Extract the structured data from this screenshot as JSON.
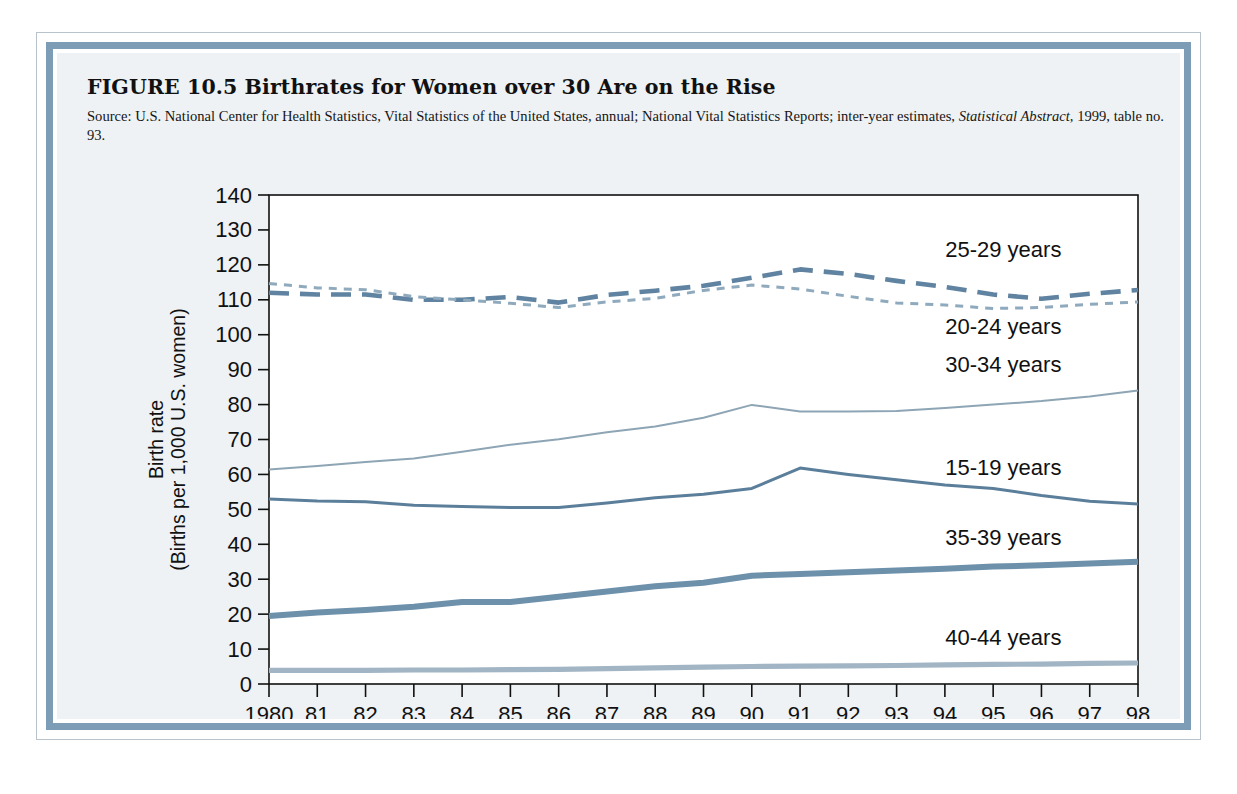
{
  "figure": {
    "title": "FIGURE 10.5  Birthrates for Women over 30 Are on the Rise",
    "source_prefix": "Source: U.S. National Center for Health Statistics, Vital Statistics of the United States, annual; National Vital Statistics Reports; inter-year estimates, ",
    "source_italic_1": "Statistical Abstract,",
    "source_suffix": " 1999, table no. 93."
  },
  "colors": {
    "frame_blue": "#7d9cb5",
    "panel_background": "#eef2f4",
    "plot_background": "#ffffff",
    "axis": "#111111",
    "series_15_19": "#5b7f9b",
    "series_20_24": "#8fa9bd",
    "series_25_29": "#5f83a0",
    "series_30_34": "#8da5b4",
    "series_35_39": "#6d90ab",
    "series_40_44": "#a2b5c4"
  },
  "chart_data": {
    "type": "line",
    "title": "Birthrates for Women over 30 Are on the Rise",
    "xlabel": "",
    "ylabel": "Birth rate (Births per 1,000 U.S. women)",
    "ylabel_line1": "Birth rate",
    "ylabel_line2": "(Births per 1,000 U.S. women)",
    "ylim": [
      0,
      140
    ],
    "yticks": [
      0,
      10,
      20,
      30,
      40,
      50,
      60,
      70,
      80,
      90,
      100,
      110,
      120,
      130,
      140
    ],
    "ytick_labels": [
      "0",
      "10",
      "20",
      "30",
      "40",
      "50",
      "60",
      "70",
      "80",
      "90",
      "100",
      "110",
      "120",
      "130",
      "140"
    ],
    "grid": false,
    "legend_position": "inline-right-labels",
    "x": [
      1980,
      1981,
      1982,
      1983,
      1984,
      1985,
      1986,
      1987,
      1988,
      1989,
      1990,
      1991,
      1992,
      1993,
      1994,
      1995,
      1996,
      1997,
      1998
    ],
    "xtick_labels": [
      "1980",
      "81",
      "82",
      "83",
      "84",
      "85",
      "86",
      "87",
      "88",
      "89",
      "90",
      "91",
      "92",
      "93",
      "94",
      "95",
      "96",
      "97",
      "98"
    ],
    "series": [
      {
        "name": "25-29 years",
        "label": "25-29 years",
        "style": "long-dash",
        "color": "#5f83a0",
        "values": [
          112.0,
          111.5,
          111.5,
          110.0,
          110.0,
          110.8,
          109.2,
          111.4,
          112.6,
          114.0,
          116.3,
          118.7,
          117.4,
          115.4,
          113.7,
          111.5,
          110.3,
          111.7,
          112.8
        ]
      },
      {
        "name": "20-24 years",
        "label": "20-24 years",
        "style": "short-dash",
        "color": "#8fa9bd",
        "values": [
          114.7,
          113.4,
          112.9,
          110.9,
          110.0,
          109.0,
          107.8,
          109.4,
          110.4,
          112.7,
          114.2,
          113.1,
          111.0,
          109.1,
          108.5,
          107.5,
          107.8,
          108.7,
          109.4
        ]
      },
      {
        "name": "30-34 years",
        "label": "30-34 years",
        "style": "thin-solid",
        "color": "#8da5b4",
        "values": [
          61.4,
          62.4,
          63.6,
          64.6,
          66.5,
          68.5,
          70.1,
          72.1,
          73.7,
          76.2,
          79.9,
          78.0,
          78.0,
          78.2,
          79.0,
          80.0,
          81.0,
          82.3,
          84.0
        ]
      },
      {
        "name": "15-19 years",
        "label": "15-19 years",
        "style": "solid",
        "color": "#5b7f9b",
        "values": [
          53.0,
          52.4,
          52.2,
          51.2,
          50.8,
          50.5,
          50.5,
          51.8,
          53.3,
          54.3,
          56.0,
          61.8,
          60.0,
          58.5,
          57.0,
          56.0,
          54.0,
          52.3,
          51.5
        ]
      },
      {
        "name": "35-39 years",
        "label": "35-39 years",
        "style": "thick-solid",
        "color": "#6d90ab",
        "values": [
          19.5,
          20.5,
          21.2,
          22.1,
          23.5,
          23.5,
          25.0,
          26.5,
          28.0,
          29.0,
          31.0,
          31.5,
          32.0,
          32.5,
          33.0,
          33.6,
          34.0,
          34.5,
          35.0
        ]
      },
      {
        "name": "40-44 years",
        "label": "40-44 years",
        "style": "thick-solid-light",
        "color": "#a2b5c4",
        "values": [
          3.9,
          3.9,
          3.9,
          4.0,
          4.0,
          4.1,
          4.2,
          4.4,
          4.6,
          4.8,
          5.0,
          5.1,
          5.2,
          5.3,
          5.5,
          5.6,
          5.7,
          5.9,
          6.0
        ]
      }
    ],
    "annotations": [
      {
        "text": "25-29 years",
        "x_frac": 0.845,
        "y_value": 124.5
      },
      {
        "text": "20-24 years",
        "x_frac": 0.845,
        "y_value": 102.5
      },
      {
        "text": "30-34 years",
        "x_frac": 0.845,
        "y_value": 91.5
      },
      {
        "text": "15-19 years",
        "x_frac": 0.845,
        "y_value": 62.0
      },
      {
        "text": "35-39 years",
        "x_frac": 0.845,
        "y_value": 42.0
      },
      {
        "text": "40-44 years",
        "x_frac": 0.845,
        "y_value": 13.5
      }
    ]
  }
}
